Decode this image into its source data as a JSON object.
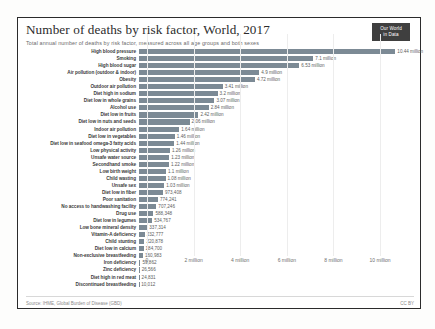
{
  "header": {
    "title": "Number of deaths by risk factor, World, 2017",
    "subtitle": "Total annual number of deaths by risk factor, measured across all age groups and both sexes",
    "logo_line1": "Our World",
    "logo_line2": "in Data"
  },
  "footer": {
    "source": "Source: IHME, Global Burden of Disease (GBD)",
    "license": "CC BY"
  },
  "colors": {
    "bar": "#7c8a95",
    "logo_bg": "#3f3f3f",
    "text": "#3a3a3a",
    "value_text": "#5d5d5d",
    "grid": "#ededed",
    "border": "#2b2b2b"
  },
  "chart_data": {
    "type": "bar",
    "orientation": "horizontal",
    "title": "Number of deaths by risk factor, World, 2017",
    "subtitle": "Total annual number of deaths by risk factor, measured across all age groups and both sexes",
    "xlabel": "",
    "ylabel": "",
    "xlim": [
      0,
      11200000
    ],
    "grid": true,
    "legend": "none",
    "xticks": [
      0,
      2000000,
      4000000,
      6000000,
      8000000,
      10000000
    ],
    "xticklabels": [
      "0",
      "2 million",
      "4 million",
      "6 million",
      "8 million",
      "10 million"
    ],
    "categories": [
      "High blood pressure",
      "Smoking",
      "High blood sugar",
      "Air pollution (outdoor & indoor)",
      "Obesity",
      "Outdoor air pollution",
      "Diet high in sodium",
      "Diet low in whole grains",
      "Alcohol use",
      "Diet low in fruits",
      "Diet low in nuts and seeds",
      "Indoor air pollution",
      "Diet low in vegetables",
      "Diet low in seafood omega-3 fatty acids",
      "Low physical activity",
      "Unsafe water source",
      "Secondhand smoke",
      "Low birth weight",
      "Child wasting",
      "Unsafe sex",
      "Diet low in fiber",
      "Poor sanitation",
      "No access to handwashing facility",
      "Drug use",
      "Diet low in legumes",
      "Low bone mineral density",
      "Vitamin-A deficiency",
      "Child stunting",
      "Diet low in calcium",
      "Non-exclusive breastfeeding",
      "Iron deficiency",
      "Zinc deficiency",
      "Diet high in red meat",
      "Discontinued breastfeeding"
    ],
    "values": [
      10440000,
      7100000,
      6530000,
      4900000,
      4720000,
      3410000,
      3200000,
      3070000,
      2840000,
      2420000,
      2060000,
      1640000,
      1460000,
      1440000,
      1260000,
      1230000,
      1220000,
      1100000,
      1080000,
      1030000,
      973408,
      774241,
      707246,
      588348,
      534767,
      337314,
      232777,
      220878,
      184700,
      160983,
      59862,
      26566,
      24831,
      10012
    ],
    "value_labels": [
      "10.44 million",
      "7.1 million",
      "6.53 million",
      "4.9 million",
      "4.72 million",
      "3.41 million",
      "3.2 million",
      "3.07 million",
      "2.84 million",
      "2.42 million",
      "2.06 million",
      "1.64 million",
      "1.46 million",
      "1.44 million",
      "1.26 million",
      "1.23 million",
      "1.22 million",
      "1.1 million",
      "1.08 million",
      "1.03 million",
      "973,408",
      "774,241",
      "707,246",
      "588,348",
      "534,767",
      "337,314",
      "232,777",
      "220,878",
      "184,700",
      "160,983",
      "59,862",
      "26,566",
      "24,831",
      "10,012"
    ]
  }
}
